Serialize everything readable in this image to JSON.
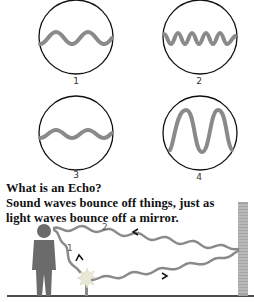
{
  "figure": {
    "panels": [
      {
        "label": "1",
        "description": "low frequency, medium amplitude wave"
      },
      {
        "label": "2",
        "description": "high frequency, medium amplitude wave"
      },
      {
        "label": "3",
        "description": "low frequency, low amplitude wave"
      },
      {
        "label": "4",
        "description": "low frequency, high amplitude wave"
      }
    ],
    "caption": {
      "title": "What is an Echo?",
      "line1": "Sound waves bounce off things, just as",
      "line2": "light waves bounce off a mirror."
    },
    "scene": {
      "path_labels": [
        "1",
        "2"
      ],
      "elements": [
        "person",
        "firecracker",
        "wall",
        "ground"
      ]
    },
    "colors": {
      "wave": "#8a8a8a",
      "circle": "#111111",
      "person": "#6b6b6b",
      "wall": "#9a9a9a",
      "text": "#111111"
    }
  }
}
